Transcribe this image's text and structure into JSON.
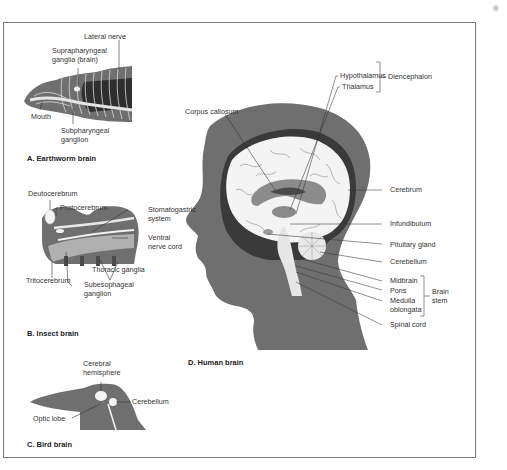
{
  "figure": {
    "panels": [
      {
        "id": "A",
        "caption": "A. Earthworm brain",
        "labels": [
          "Lateral nerve",
          "Suprapharyngeal",
          "ganglia (brain)",
          "Mouth",
          "Subpharyngeal",
          "ganglion"
        ]
      },
      {
        "id": "B",
        "caption": "B. Insect brain",
        "labels": [
          "Deutocerebrum",
          "Protocerebrum",
          "Stomatogastric",
          "system",
          "Ventral",
          "nerve cord",
          "Thoracic ganglia",
          "Tritocerebrum",
          "Subesophageal",
          "ganglion"
        ]
      },
      {
        "id": "C",
        "caption": "C. Bird brain",
        "labels": [
          "Cerebral",
          "hemisphere",
          "Cerebellum",
          "Optic lobe"
        ]
      },
      {
        "id": "D",
        "caption": "D. Human brain",
        "labels": [
          "Corpus callosum",
          "Hypothalamus",
          "Thalamus",
          "Diencephalon",
          "Cerebrum",
          "Infundibulum",
          "Pituitary gland",
          "Cerebellum",
          "Midbrain",
          "Pons",
          "Medulla",
          "oblongata",
          "Brain",
          "stem",
          "Spinal cord"
        ]
      }
    ]
  },
  "colors": {
    "silhouette": "#6f6f6f",
    "brain_fill": "#f4f4f4",
    "dark_region": "#4a4a4a",
    "frame": "#7a7a7a",
    "text": "#333333"
  }
}
